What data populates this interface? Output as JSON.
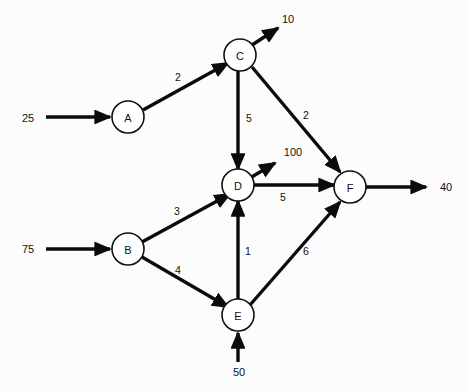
{
  "diagram": {
    "type": "directed-network-flow",
    "background_color": "#fcfcfc",
    "line_color": "#0b0b0b",
    "node_fill": "#ffffff",
    "nodes": [
      {
        "id": "A",
        "label": "A",
        "cx": 128,
        "cy": 117,
        "r": 16
      },
      {
        "id": "B",
        "label": "B",
        "cx": 128,
        "cy": 249,
        "r": 16
      },
      {
        "id": "C",
        "label": "C",
        "cx": 240,
        "cy": 55,
        "r": 16
      },
      {
        "id": "D",
        "label": "D",
        "cx": 238,
        "cy": 185,
        "r": 16
      },
      {
        "id": "E",
        "label": "E",
        "cx": 238,
        "cy": 315,
        "r": 16
      },
      {
        "id": "F",
        "label": "F",
        "cx": 350,
        "cy": 187,
        "r": 16
      }
    ],
    "edges": [
      {
        "from": "A",
        "to": "C",
        "value": "2",
        "label_x": 178,
        "label_y": 77,
        "x1": 143,
        "y1": 110,
        "x2": 228,
        "y2": 63
      },
      {
        "from": "B",
        "to": "C",
        "value": "3",
        "label_x": 177,
        "label_y": 211,
        "x1": 142,
        "y1": 242,
        "x2": 230,
        "y2": 194
      },
      {
        "from": "B",
        "to": "E",
        "value": "4",
        "label_x": 178,
        "label_y": 270,
        "x1": 142,
        "y1": 257,
        "x2": 228,
        "y2": 307
      },
      {
        "from": "C",
        "to": "D",
        "value": "5",
        "label_x": 249,
        "label_y": 118,
        "x1": 238,
        "y1": 71,
        "x2": 238,
        "y2": 169
      },
      {
        "from": "C",
        "to": "F",
        "value": "2",
        "label_x": 306,
        "label_y": 115,
        "x1": 252,
        "y1": 67,
        "x2": 340,
        "y2": 172
      },
      {
        "from": "E",
        "to": "D",
        "value": "1",
        "label_x": 248,
        "label_y": 251,
        "x1": 238,
        "y1": 299,
        "x2": 238,
        "y2": 201
      },
      {
        "from": "E",
        "to": "F",
        "value": "6",
        "label_x": 306,
        "label_y": 251,
        "x1": 250,
        "y1": 305,
        "x2": 340,
        "y2": 202
      },
      {
        "from": "D",
        "to": "F",
        "value": "5",
        "label_x": 283,
        "label_y": 197,
        "x1": 254,
        "y1": 185,
        "x2": 334,
        "y2": 185
      }
    ],
    "inputs": [
      {
        "value": "25",
        "to": "A",
        "label_x": 28,
        "label_y": 118,
        "x1": 46,
        "y1": 117,
        "x2": 110,
        "y2": 117
      },
      {
        "value": "75",
        "to": "B",
        "label_x": 28,
        "label_y": 249,
        "x1": 46,
        "y1": 249,
        "x2": 110,
        "y2": 249
      },
      {
        "value": "50",
        "to": "E",
        "label_x": 239,
        "label_y": 372,
        "x1": 238,
        "y1": 362,
        "x2": 238,
        "y2": 333
      }
    ],
    "outputs": [
      {
        "value": "10",
        "from": "C",
        "label_x": 288,
        "label_y": 19,
        "x1": 252,
        "y1": 45,
        "x2": 278,
        "y2": 28
      },
      {
        "value": "100",
        "from": "D",
        "label_x": 293,
        "label_y": 152,
        "x1": 250,
        "y1": 178,
        "x2": 275,
        "y2": 163
      },
      {
        "value": "40",
        "from": "F",
        "label_x": 446,
        "label_y": 187,
        "x1": 366,
        "y1": 187,
        "x2": 426,
        "y2": 187
      }
    ]
  }
}
